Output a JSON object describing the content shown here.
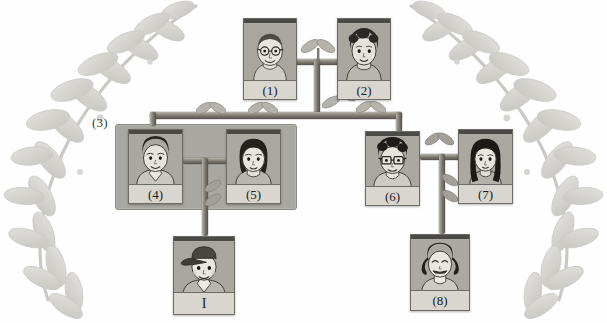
{
  "diagram": {
    "background_color": "#ffffff",
    "card_color": "#9e9c96",
    "label_strip_color": "#d8d6cf",
    "branch_color": "#6f6b63",
    "group_box_color": "#a9a7a1",
    "decoration": "laurel-branch"
  },
  "group": {
    "label": "(3)",
    "members": [
      "(4)",
      "(5)"
    ]
  },
  "cards": [
    {
      "id": "person-1",
      "label": "(1)",
      "portrait": "elderly-man-glasses"
    },
    {
      "id": "person-2",
      "label": "(2)",
      "portrait": "elderly-woman-curly-hair"
    },
    {
      "id": "person-4",
      "label": "(4)",
      "portrait": "man-short-hair-collar-shirt"
    },
    {
      "id": "person-5",
      "label": "(5)",
      "portrait": "woman-bob-hair"
    },
    {
      "id": "person-6",
      "label": "(6)",
      "portrait": "man-glasses-curly-hair"
    },
    {
      "id": "person-7",
      "label": "(7)",
      "portrait": "woman-long-hair"
    },
    {
      "id": "person-self",
      "label": "I",
      "portrait": "boy-with-cap"
    },
    {
      "id": "person-8",
      "label": "(8)",
      "portrait": "girl-pigtails-laughing"
    }
  ],
  "connectors": [
    {
      "name": "spouse-link-1-2",
      "from": "(1)",
      "to": "(2)"
    },
    {
      "name": "descend-1-2",
      "from": "(1)(2)",
      "to": "sibling-bar"
    },
    {
      "name": "sibling-bar",
      "from": "(3)",
      "to": "(6)"
    },
    {
      "name": "spouse-link-4-5",
      "from": "(4)",
      "to": "(5)"
    },
    {
      "name": "descend-4-5",
      "from": "(4)(5)",
      "to": "I"
    },
    {
      "name": "spouse-link-6-7",
      "from": "(6)",
      "to": "(7)"
    },
    {
      "name": "descend-6-7",
      "from": "(6)(7)",
      "to": "(8)"
    }
  ]
}
